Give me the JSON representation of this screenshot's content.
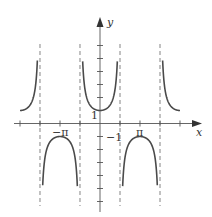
{
  "chart_data": {
    "type": "line",
    "title": "",
    "function": "y = sec x",
    "xlabel": "x",
    "ylabel": "y",
    "xlim": [
      -6.8,
      7.6
    ],
    "ylim": [
      -6.7,
      8.0
    ],
    "grid": false,
    "legend": null,
    "x_tick_labels": [
      {
        "value": -3.14159,
        "label": "−π"
      },
      {
        "value": 3.14159,
        "label": "π"
      }
    ],
    "y_tick_labels": [
      {
        "value": 1,
        "label": "1"
      },
      {
        "value": -1,
        "label": "−1"
      }
    ],
    "x_ticks": [
      -6.28318,
      -4.71239,
      -3.14159,
      -1.5708,
      1.5708,
      3.14159,
      4.71239,
      6.28318
    ],
    "y_ticks": [
      -6,
      -5,
      -4,
      -3,
      -2,
      -1,
      1,
      2,
      3,
      4,
      5,
      6
    ],
    "asymptotes": [
      -4.71239,
      -1.5708,
      1.5708,
      4.71239
    ],
    "series": [
      {
        "name": "sec x branch 1",
        "x_range": [
          -6.28318,
          -4.92
        ],
        "sign": 1
      },
      {
        "name": "sec x branch 2",
        "x_range": [
          -4.5,
          -1.78
        ],
        "sign": -1
      },
      {
        "name": "sec x branch 3",
        "x_range": [
          -1.36,
          1.36
        ],
        "sign": 1
      },
      {
        "name": "sec x branch 4",
        "x_range": [
          1.78,
          4.5
        ],
        "sign": -1
      },
      {
        "name": "sec x branch 5",
        "x_range": [
          4.92,
          6.28318
        ],
        "sign": 1
      }
    ],
    "colors": {
      "curve": "#4a4a4a",
      "axis": "#555555",
      "asymptote": "#777777"
    }
  },
  "labels": {
    "x_axis": "x",
    "y_axis": "y",
    "neg_pi": "−π",
    "pos_pi": "π",
    "one": "1",
    "neg_one": "−1"
  }
}
